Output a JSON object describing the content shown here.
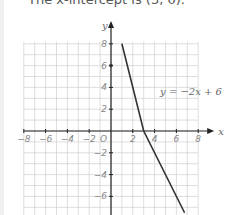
{
  "caption": "The x-intercept is (3, 0).",
  "chart_data": {
    "type": "line",
    "title": "",
    "xlabel": "x",
    "ylabel": "y",
    "xlim": [
      -8,
      8
    ],
    "ylim": [
      -7.5,
      8
    ],
    "grid": true,
    "x_ticks": [
      "-8",
      "-6",
      "-4",
      "-2",
      "2",
      "4",
      "6",
      "8"
    ],
    "y_ticks": [
      "8",
      "6",
      "4",
      "2",
      "-2",
      "-4",
      "-6"
    ],
    "origin_label": "O",
    "series": [
      {
        "name": "y = -2x + 6",
        "equation": "y = -2x + 6",
        "x": [
          1,
          3,
          6.75
        ],
        "y": [
          8,
          0,
          -7.5
        ]
      }
    ],
    "annotations": [
      {
        "text": "y = -2x + 6",
        "x": 4.5,
        "y": 3.3
      }
    ],
    "line_color": "#333333",
    "grid_color": "#d0d0d0"
  }
}
